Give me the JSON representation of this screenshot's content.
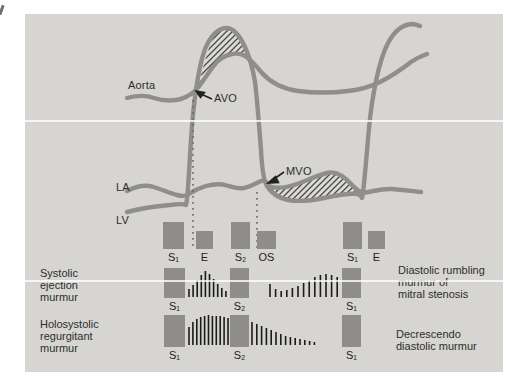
{
  "figure": {
    "description_labels": {
      "aorta": "Aorta",
      "la": "LA",
      "lv": "LV",
      "avo": "AVO",
      "mvo": "MVO"
    },
    "captions": {
      "systolic_ejection": [
        "Systolic",
        "ejection",
        "murmur"
      ],
      "holosystolic": [
        "Holosystolic",
        "regurgitant",
        "murmur"
      ],
      "diastolic_rumbling": [
        "Diastolic rumbling",
        "murmur of",
        "mitral stenosis"
      ],
      "decrescendo": [
        "Decrescendo",
        "diastolic murmur"
      ]
    }
  },
  "colors": {
    "panel_bg": "#d6d5d2",
    "curve": "#8f8e8c",
    "block": "#8e8d89",
    "murmur_line": "#1b1b1b",
    "text": "#2d2d2d",
    "dotted_line": "#696967",
    "hatch_line": "#4a4a48",
    "hatch_bg": "#dcdbd8"
  },
  "heart_sounds": [
    {
      "label": "S₁",
      "x": 163,
      "y": 222,
      "w": 21,
      "h": 27
    },
    {
      "label": "E",
      "x": 196,
      "y": 231,
      "w": 17,
      "h": 18
    },
    {
      "label": "S₂",
      "x": 231,
      "y": 222,
      "w": 19,
      "h": 27
    },
    {
      "label": "OS",
      "x": 257,
      "y": 231,
      "w": 19,
      "h": 18
    },
    {
      "label": "S₁",
      "x": 343,
      "y": 222,
      "w": 19,
      "h": 27
    },
    {
      "label": "E",
      "x": 368,
      "y": 231,
      "w": 17,
      "h": 18
    }
  ],
  "murmur_blocks": [
    {
      "label": "S₁",
      "x": 164,
      "y": 268,
      "w": 21,
      "h": 30
    },
    {
      "label": "S₂",
      "x": 230,
      "y": 268,
      "w": 19,
      "h": 30
    },
    {
      "label": "S₁",
      "x": 342,
      "y": 268,
      "w": 19,
      "h": 30
    },
    {
      "label": "S₁",
      "x": 164,
      "y": 315,
      "w": 21,
      "h": 32
    },
    {
      "label": "S₂",
      "x": 230,
      "y": 315,
      "w": 19,
      "h": 32
    },
    {
      "label": "S₁",
      "x": 342,
      "y": 315,
      "w": 19,
      "h": 32
    }
  ],
  "murmur_patterns": [
    {
      "name": "systolic-ejection-crescendo-decrescendo",
      "x0": 189,
      "dx": 4.1,
      "base": 297,
      "heights": [
        8,
        12,
        17,
        22,
        26,
        23,
        18,
        13,
        9,
        6
      ]
    },
    {
      "name": "diastolic-rumbling-mitral-stenosis",
      "x0": 270,
      "dx": 5.6,
      "base": 297,
      "heights": [
        13,
        8,
        6,
        7,
        9,
        11,
        14,
        17,
        20,
        22,
        23,
        22,
        20
      ]
    },
    {
      "name": "holosystolic-plateau",
      "x0": 189,
      "dx": 3.9,
      "base": 345,
      "heights": [
        18,
        23,
        26,
        28,
        29,
        30,
        29,
        29,
        29,
        28,
        27
      ]
    },
    {
      "name": "decrescendo-diastolic",
      "x0": 252,
      "dx": 4.8,
      "base": 345,
      "heights": [
        23,
        21,
        19,
        17,
        15,
        13,
        11,
        9,
        8,
        7,
        6,
        5,
        4,
        3
      ]
    }
  ],
  "dotted_lines": [
    {
      "name": "avo-timing-line",
      "x": 193,
      "y1": 100,
      "y2": 248
    },
    {
      "name": "mvo-timing-line",
      "x": 257,
      "y1": 192,
      "y2": 248
    }
  ]
}
